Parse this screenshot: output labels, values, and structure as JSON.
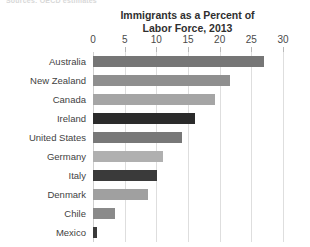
{
  "source_sliver": "Sources: OECD estimates",
  "chart": {
    "title_line1": "Immigrants as a Percent of",
    "title_line2": "Labor Force, 2013"
  },
  "colors": {
    "bar_default": "#9a9a9a",
    "bar_highlight": "#2b2b2b",
    "gridline": "#dedede",
    "text": "#3d3d3d",
    "background": "#ffffff"
  },
  "chart_data": {
    "type": "bar",
    "orientation": "horizontal",
    "title": "Immigrants as a Percent of Labor Force, 2013",
    "xlabel": "",
    "ylabel": "",
    "xlim": [
      0,
      30
    ],
    "xticks": [
      0,
      5,
      10,
      15,
      20,
      25,
      30
    ],
    "xtick_labels": [
      "0",
      "5",
      "10",
      "15",
      "20",
      "25",
      "30"
    ],
    "grid": true,
    "legend": false,
    "categories": [
      "Australia",
      "New Zealand",
      "Canada",
      "Ireland",
      "United States",
      "Germany",
      "Italy",
      "Denmark",
      "Chile",
      "Mexico"
    ],
    "values": [
      27.0,
      21.6,
      19.3,
      16.1,
      14.1,
      11.1,
      10.1,
      8.7,
      3.5,
      0.6
    ],
    "bar_shades": [
      "#767676",
      "#8f8f8f",
      "#a5a5a5",
      "#2b2b2b",
      "#787878",
      "#b0b0b0",
      "#3a3a3a",
      "#a0a0a0",
      "#8a8a8a",
      "#3a3a3a"
    ],
    "highlighted": [
      "Ireland",
      "Italy"
    ]
  }
}
